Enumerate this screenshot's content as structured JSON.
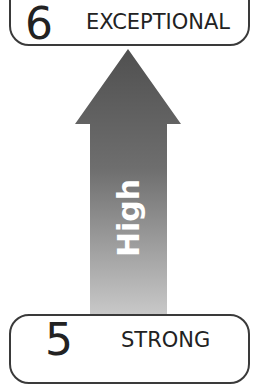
{
  "levels": [
    {
      "number": "6",
      "label": "EXCEPTIONAL"
    },
    {
      "number": "5",
      "label": "STRONG"
    }
  ],
  "arrow": {
    "label": "High",
    "direction": "up",
    "color_top": "#505050",
    "color_bottom": "#c4c4c4"
  },
  "colors": {
    "border": "#3a3a3a",
    "text": "#222222",
    "arrow_text": "#ffffff"
  }
}
